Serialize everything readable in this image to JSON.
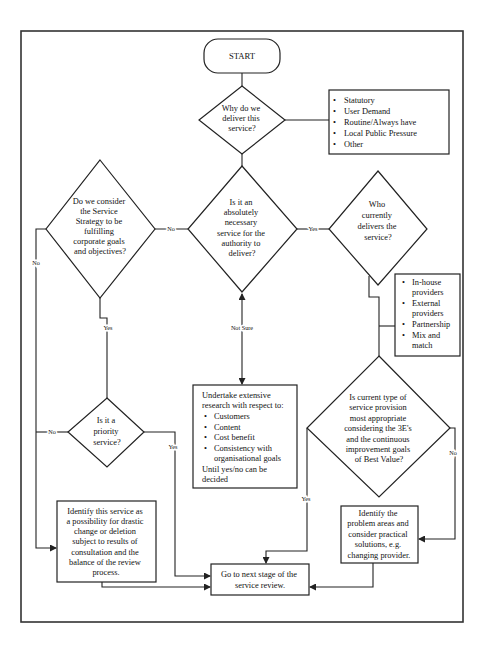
{
  "colors": {
    "line": "#222222",
    "background": "#ffffff"
  },
  "flowchart": {
    "start": "START",
    "q_why": [
      "Why do we",
      "deliver this",
      "service?"
    ],
    "reasons": [
      "Statutory",
      "User Demand",
      "Routine/Always have",
      "Local Public Pressure",
      "Other"
    ],
    "q_necessary": [
      "Is it an",
      "absolutely",
      "necessary",
      "service for the",
      "authority to",
      "deliver?"
    ],
    "q_corporate": [
      "Do we consider",
      "the Service",
      "Strategy to be",
      "fulfilling",
      "corporate goals",
      "and objectives?"
    ],
    "q_who": [
      "Who",
      "currently",
      "delivers the",
      "service?"
    ],
    "providers": [
      [
        "In-house",
        "providers"
      ],
      [
        "External",
        "providers"
      ],
      [
        "Partnership"
      ],
      [
        "Mix and",
        "match"
      ]
    ],
    "q_current": [
      "Is current type of",
      "service provision",
      "most appropriate",
      "considering the 3E's",
      "and the continuous",
      "improvement goals",
      "of Best Value?"
    ],
    "q_priority": [
      "Is it a",
      "priority",
      "service?"
    ],
    "research": {
      "intro": [
        "Undertake extensive",
        "research with respect to:"
      ],
      "items": [
        [
          "Customers"
        ],
        [
          "Content"
        ],
        [
          "Cost benefit"
        ],
        [
          "Consistency with",
          "organisational goals"
        ]
      ],
      "outro": [
        "Until yes/no can be",
        "decided"
      ]
    },
    "drastic": [
      "Identify this service as",
      "a possibility for drastic",
      "change or deletion",
      "subject to results of",
      "consultation and the",
      "balance of the review",
      "process."
    ],
    "problems": [
      "Identify the",
      "problem areas and",
      "consider practical",
      "solutions, e.g.",
      "changing provider."
    ],
    "next_stage": [
      "Go to next stage of the",
      "service review."
    ],
    "labels": {
      "no_necessary": "No",
      "yes_necessary": "Yes",
      "no_corporate": "No",
      "yes_corporate": "Yes",
      "not_sure": "Not Sure",
      "no_priority": "No",
      "yes_priority": "Yes",
      "yes_current": "Yes",
      "no_current": "No"
    }
  }
}
